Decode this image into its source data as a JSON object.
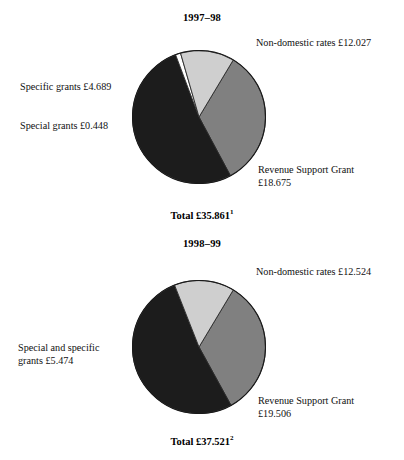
{
  "chart_data": [
    {
      "type": "pie",
      "title": "1997–98",
      "total_label": "Total £35.861",
      "total_footnote": "1",
      "total_value": 35.861,
      "currency": "£ billion",
      "start_angle_deg": 31,
      "direction": "clockwise",
      "center": {
        "x": 199,
        "y": 117
      },
      "radius": 67,
      "slices": [
        {
          "name": "non-domestic-rates",
          "label": "Non-domestic rates  £12.027",
          "value": 12.027,
          "angle_deg": 120.7,
          "color": "#808080"
        },
        {
          "name": "revenue-support-grant",
          "label": "Revenue Support Grant\n£18.675",
          "value": 18.675,
          "angle_deg": 187.5,
          "color": "#1c1c1c"
        },
        {
          "name": "special-grants",
          "label": "Special grants  £0.448",
          "value": 0.448,
          "angle_deg": 4.5,
          "color": "#ffffff"
        },
        {
          "name": "specific-grants",
          "label": "Specific grants  £4.689",
          "value": 4.689,
          "angle_deg": 47.1,
          "color": "#cfcfcf"
        }
      ]
    },
    {
      "type": "pie",
      "title": "1998–99",
      "total_label": "Total £37.521",
      "total_footnote": "2",
      "total_value": 37.521,
      "currency": "£ billion",
      "start_angle_deg": 31,
      "direction": "clockwise",
      "center": {
        "x": 199,
        "y": 347
      },
      "radius": 67,
      "slices": [
        {
          "name": "non-domestic-rates",
          "label": "Non-domestic rates  £12.524",
          "value": 12.524,
          "angle_deg": 120.2,
          "color": "#808080"
        },
        {
          "name": "revenue-support-grant",
          "label": "Revenue Support Grant\n£19.506",
          "value": 19.506,
          "angle_deg": 187.2,
          "color": "#1c1c1c"
        },
        {
          "name": "special-and-specific-grants",
          "label": "Special and specific\ngrants  £5.474",
          "value": 5.474,
          "angle_deg": 52.5,
          "color": "#cfcfcf"
        }
      ]
    }
  ],
  "chart1": {
    "title": "1997–98",
    "labels": {
      "non_domestic": "Non-domestic rates  £12.027",
      "specific_grants": "Specific grants  £4.689",
      "special_grants": "Special grants  £0.448",
      "revenue_support": "Revenue Support Grant\n£18.675"
    },
    "total": "Total £35.861",
    "footnote": "1"
  },
  "chart2": {
    "title": "1998–99",
    "labels": {
      "non_domestic": "Non-domestic rates  £12.524",
      "special_and_specific": "Special and specific\ngrants  £5.474",
      "revenue_support": "Revenue Support Grant\n£19.506"
    },
    "total": "Total £37.521",
    "footnote": "2"
  }
}
